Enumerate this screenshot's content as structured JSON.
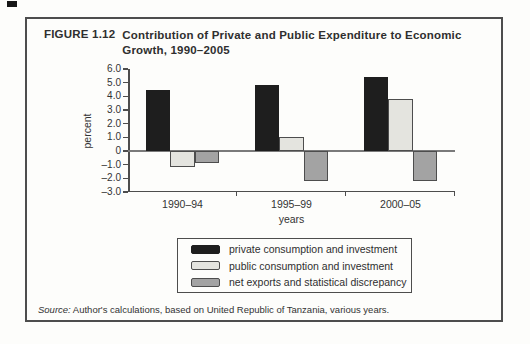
{
  "figure": {
    "label": "FIGURE 1.12",
    "title_line1": "Contribution of Private and Public Expenditure to Economic",
    "title_line2": "Growth, 1990–2005"
  },
  "source": {
    "prefix": "Source:",
    "text": " Author's calculations, based on United Republic of Tanzania, various years."
  },
  "colors": {
    "figure_border": "#4d4d4d",
    "axis": "#4d4d4d",
    "zero_line": "#7a7a7a",
    "bar_border": "#4d4d4d",
    "paper": "#fdfdfb"
  },
  "chart_data": {
    "type": "bar",
    "title": "Contribution of Private and Public Expenditure to Economic Growth, 1990–2005",
    "categories": [
      "1990–94",
      "1995–99",
      "2000–05"
    ],
    "series": [
      {
        "name": "private consumption and investment",
        "color": "#1e1e1e",
        "values": [
          4.5,
          4.8,
          5.4
        ]
      },
      {
        "name": "public consumption and investment",
        "color": "#e4e4df",
        "values": [
          -1.2,
          1.0,
          3.8
        ]
      },
      {
        "name": "net exports and statistical discrepancy",
        "color": "#a3a3a3",
        "values": [
          -0.9,
          -2.2,
          -2.2
        ]
      }
    ],
    "xlabel": "years",
    "ylabel": "percent",
    "ylim": [
      -3.0,
      6.0
    ],
    "y_ticks": [
      {
        "v": 6,
        "label": "6.0"
      },
      {
        "v": 5,
        "label": "5.0"
      },
      {
        "v": 4,
        "label": "4.0"
      },
      {
        "v": 3,
        "label": "3.0"
      },
      {
        "v": 2,
        "label": "2.0"
      },
      {
        "v": 1,
        "label": "1.0"
      },
      {
        "v": 0,
        "label": "0"
      },
      {
        "v": -1,
        "label": "–1.0"
      },
      {
        "v": -2,
        "label": "–2.0"
      },
      {
        "v": -3,
        "label": "–3.0"
      }
    ],
    "grid": false,
    "legend_position": "boxed-below"
  }
}
